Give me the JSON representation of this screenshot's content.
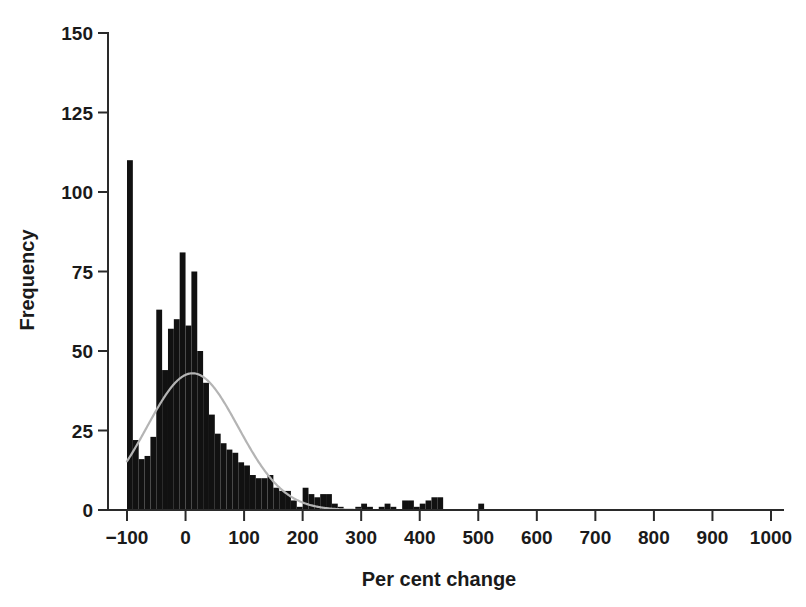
{
  "chart_data": {
    "type": "bar",
    "title": "",
    "subtitle": "",
    "xlabel": "Per cent change",
    "ylabel": "Frequency",
    "xlim": [
      -100,
      1000
    ],
    "ylim": [
      0,
      150
    ],
    "grid": false,
    "legend": null,
    "bin_width": 10,
    "x_ticks": [
      -100,
      0,
      100,
      200,
      300,
      400,
      500,
      600,
      700,
      800,
      900,
      1000
    ],
    "x_tick_labels": [
      "−100",
      "0",
      "100",
      "200",
      "300",
      "400",
      "500",
      "600",
      "700",
      "800",
      "900",
      "1000"
    ],
    "y_ticks": [
      0,
      25,
      50,
      75,
      100,
      125,
      150
    ],
    "y_tick_labels": [
      "0",
      "25",
      "50",
      "75",
      "100",
      "125",
      "150"
    ],
    "bar_color": "#111111",
    "curve_color": "#b4b4b4",
    "axis_color": "#2a2a2a",
    "background_color": "#ffffff",
    "bins": [
      {
        "x0": -100,
        "x1": -90,
        "value": 110
      },
      {
        "x0": -90,
        "x1": -80,
        "value": 22
      },
      {
        "x0": -80,
        "x1": -70,
        "value": 16
      },
      {
        "x0": -70,
        "x1": -60,
        "value": 17
      },
      {
        "x0": -60,
        "x1": -50,
        "value": 23
      },
      {
        "x0": -50,
        "x1": -40,
        "value": 63
      },
      {
        "x0": -40,
        "x1": -30,
        "value": 44
      },
      {
        "x0": -30,
        "x1": -20,
        "value": 57
      },
      {
        "x0": -20,
        "x1": -10,
        "value": 60
      },
      {
        "x0": -10,
        "x1": 0,
        "value": 81
      },
      {
        "x0": 0,
        "x1": 10,
        "value": 58
      },
      {
        "x0": 10,
        "x1": 20,
        "value": 75
      },
      {
        "x0": 20,
        "x1": 30,
        "value": 50
      },
      {
        "x0": 30,
        "x1": 40,
        "value": 40
      },
      {
        "x0": 40,
        "x1": 50,
        "value": 30
      },
      {
        "x0": 50,
        "x1": 60,
        "value": 24
      },
      {
        "x0": 60,
        "x1": 70,
        "value": 21
      },
      {
        "x0": 70,
        "x1": 80,
        "value": 19
      },
      {
        "x0": 80,
        "x1": 90,
        "value": 18
      },
      {
        "x0": 90,
        "x1": 100,
        "value": 15
      },
      {
        "x0": 100,
        "x1": 110,
        "value": 14
      },
      {
        "x0": 110,
        "x1": 120,
        "value": 11
      },
      {
        "x0": 120,
        "x1": 130,
        "value": 10
      },
      {
        "x0": 130,
        "x1": 140,
        "value": 10
      },
      {
        "x0": 140,
        "x1": 150,
        "value": 11
      },
      {
        "x0": 150,
        "x1": 160,
        "value": 7
      },
      {
        "x0": 160,
        "x1": 170,
        "value": 6
      },
      {
        "x0": 170,
        "x1": 180,
        "value": 6
      },
      {
        "x0": 180,
        "x1": 190,
        "value": 3
      },
      {
        "x0": 190,
        "x1": 200,
        "value": 1
      },
      {
        "x0": 200,
        "x1": 210,
        "value": 7
      },
      {
        "x0": 210,
        "x1": 220,
        "value": 5
      },
      {
        "x0": 220,
        "x1": 230,
        "value": 4
      },
      {
        "x0": 230,
        "x1": 240,
        "value": 5
      },
      {
        "x0": 240,
        "x1": 250,
        "value": 5
      },
      {
        "x0": 250,
        "x1": 260,
        "value": 2
      },
      {
        "x0": 260,
        "x1": 270,
        "value": 1
      },
      {
        "x0": 270,
        "x1": 280,
        "value": 0
      },
      {
        "x0": 280,
        "x1": 290,
        "value": 0
      },
      {
        "x0": 290,
        "x1": 300,
        "value": 1
      },
      {
        "x0": 300,
        "x1": 310,
        "value": 2
      },
      {
        "x0": 310,
        "x1": 320,
        "value": 1
      },
      {
        "x0": 320,
        "x1": 330,
        "value": 0
      },
      {
        "x0": 330,
        "x1": 340,
        "value": 1
      },
      {
        "x0": 340,
        "x1": 350,
        "value": 2
      },
      {
        "x0": 350,
        "x1": 360,
        "value": 1
      },
      {
        "x0": 360,
        "x1": 370,
        "value": 0
      },
      {
        "x0": 370,
        "x1": 380,
        "value": 3
      },
      {
        "x0": 380,
        "x1": 390,
        "value": 3
      },
      {
        "x0": 390,
        "x1": 400,
        "value": 1
      },
      {
        "x0": 400,
        "x1": 410,
        "value": 2
      },
      {
        "x0": 410,
        "x1": 420,
        "value": 3
      },
      {
        "x0": 420,
        "x1": 430,
        "value": 4
      },
      {
        "x0": 430,
        "x1": 440,
        "value": 4
      },
      {
        "x0": 440,
        "x1": 450,
        "value": 0
      },
      {
        "x0": 450,
        "x1": 460,
        "value": 0
      },
      {
        "x0": 460,
        "x1": 470,
        "value": 0
      },
      {
        "x0": 470,
        "x1": 480,
        "value": 0
      },
      {
        "x0": 480,
        "x1": 490,
        "value": 0
      },
      {
        "x0": 490,
        "x1": 500,
        "value": 0
      },
      {
        "x0": 500,
        "x1": 510,
        "value": 2
      },
      {
        "x0": 510,
        "x1": 520,
        "value": 0
      }
    ],
    "overlay_curve": {
      "name": "normal-fit",
      "kind": "normal",
      "mean": 12,
      "sd": 78,
      "peak_value": 43,
      "x_start": -100,
      "x_end": 300
    }
  }
}
